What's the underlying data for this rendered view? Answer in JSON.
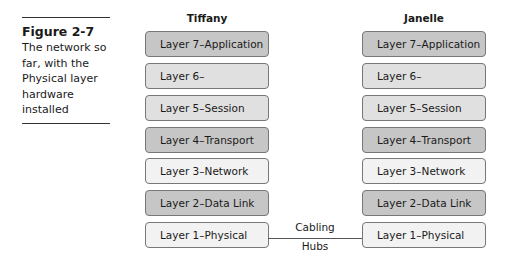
{
  "caption": {
    "figure_label": "Figure 2-7",
    "description": "The network so far, with the Physical layer hardware installed"
  },
  "hosts": [
    {
      "name": "Tiffany",
      "layers": [
        {
          "label": "Layer 7–Application",
          "shade": "dark"
        },
        {
          "label": "Layer 6–Presentation",
          "shade": "mid"
        },
        {
          "label": "Layer 5–Session",
          "shade": "mid"
        },
        {
          "label": "Layer 4–Transport",
          "shade": "dark"
        },
        {
          "label": "Layer 3–Network",
          "shade": "light"
        },
        {
          "label": "Layer 2–Data Link",
          "shade": "dark"
        },
        {
          "label": "Layer 1–Physical",
          "shade": "light"
        }
      ]
    },
    {
      "name": "Janelle",
      "layers": [
        {
          "label": "Layer 7–Application",
          "shade": "dark"
        },
        {
          "label": "Layer 6–Presentation",
          "shade": "mid"
        },
        {
          "label": "Layer 5–Session",
          "shade": "mid"
        },
        {
          "label": "Layer 4–Transport",
          "shade": "dark"
        },
        {
          "label": "Layer 3–Network",
          "shade": "light"
        },
        {
          "label": "Layer 2–Data Link",
          "shade": "dark"
        },
        {
          "label": "Layer 1–Physical",
          "shade": "light"
        }
      ]
    }
  ],
  "connection": {
    "label_top": "Cabling",
    "label_bottom": "Hubs"
  },
  "colors": {
    "dark": "#c6c6c6",
    "mid": "#e0e0e0",
    "light": "#f2f2f2",
    "border": "#777777"
  }
}
